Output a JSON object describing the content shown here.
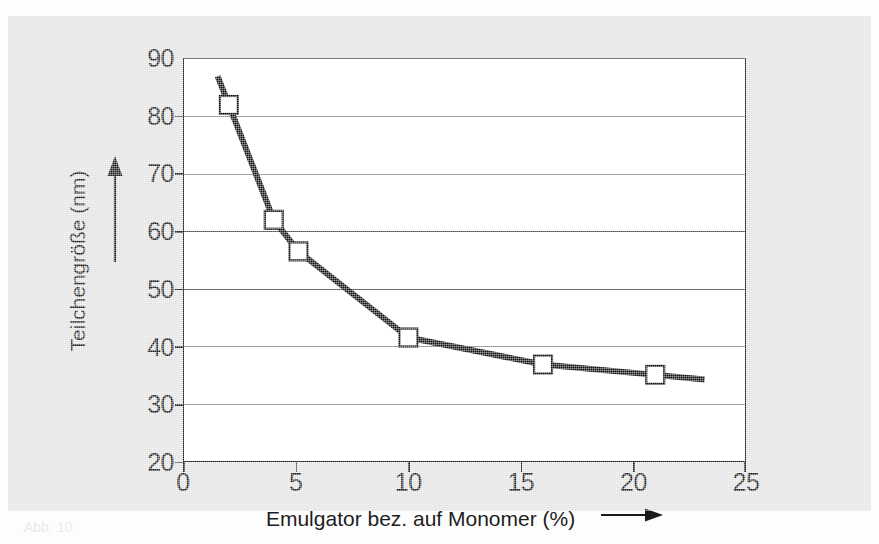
{
  "figure": {
    "caption_fragment": "Abb. 10",
    "background_color": "#e2e2e2",
    "plot_background_color": "#ffffff",
    "line_color": "#111111",
    "marker_fill_color": "#ffffff",
    "gridline_color": "#555555"
  },
  "axes": {
    "x_title": "Emulgator bez. auf Monomer (%)",
    "y_title": "Teilchengröße (nm)",
    "x_arrow_icon": "right-arrow-icon",
    "y_arrow_icon": "up-arrow-icon"
  },
  "chart_data": {
    "type": "line",
    "title": "",
    "subtitle": "",
    "xlabel": "Emulgator bez. auf Monomer (%)",
    "ylabel": "Teilchengröße (nm)",
    "xlim": [
      0,
      25
    ],
    "ylim": [
      20,
      90
    ],
    "xticks": [
      0,
      5,
      10,
      15,
      20,
      25
    ],
    "yticks": [
      20,
      30,
      40,
      50,
      60,
      70,
      80,
      90
    ],
    "xtick_labels": [
      "0",
      "5",
      "10",
      "15",
      "20",
      "25"
    ],
    "ytick_labels": [
      "20",
      "30",
      "40",
      "50",
      "60",
      "70",
      "80",
      "90"
    ],
    "grid": "horizontal",
    "legend": "none",
    "series": [
      {
        "name": "Teilchengröße",
        "marker": "open-square",
        "line_width_px": 6,
        "x": [
          1.5,
          2.0,
          4.0,
          5.1,
          10.0,
          16.0,
          21.0,
          23.2
        ],
        "y": [
          87.0,
          82.0,
          62.0,
          56.5,
          41.5,
          36.8,
          35.0,
          34.2
        ],
        "marker_at": [
          false,
          true,
          true,
          true,
          true,
          true,
          true,
          false
        ]
      }
    ],
    "annotations": []
  }
}
